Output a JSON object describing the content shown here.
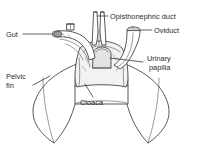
{
  "figure": {
    "background_color": "#ffffff",
    "line_color": "#3a3a3a",
    "text_color": "#2b2b2b",
    "width": 203,
    "height": 146
  },
  "labels": {
    "opisthonephric_duct": "Opisthonephric duct",
    "oviduct": "Oviduct",
    "gut": "Gut",
    "urinary_papilla_line1": "Urinary",
    "urinary_papilla_line2": "papilla",
    "pelvic_fin_line1": "Pelvic",
    "pelvic_fin_line2": "fin",
    "cloaca": "Cloaca"
  },
  "parts": {
    "gut": "gut-tube",
    "oviduct": "oviduct-tube",
    "opisthonephric_duct": "opisthonephric-duct-tubes",
    "urinary_papilla": "urinary-papilla-bump",
    "cloaca": "cloaca-chamber",
    "pelvic_fin_left": "left-pelvic-fin",
    "pelvic_fin_right": "right-pelvic-fin"
  }
}
